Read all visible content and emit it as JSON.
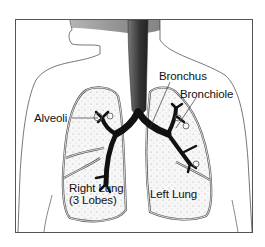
{
  "diagram": {
    "labels": {
      "bronchus": "Bronchus",
      "bronchiole": "Bronchiole",
      "alveoli": "Alveoli",
      "right_lung_line1": "Right Lung",
      "right_lung_line2": "(3 Lobes)",
      "left_lung": "Left Lung"
    },
    "colors": {
      "outline": "#555555",
      "airway": "#111111",
      "trachea_shading": "#3a3a3a",
      "lung_fill": "#f2f2f2",
      "background": "#ffffff"
    }
  }
}
